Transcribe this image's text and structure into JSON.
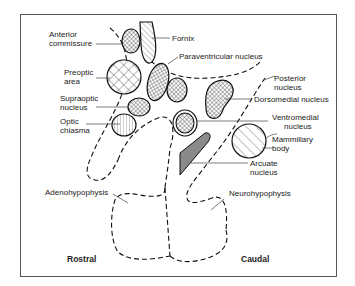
{
  "figure": {
    "type": "anatomical-diagram",
    "orientation": {
      "left": "Rostral",
      "right": "Caudal"
    },
    "colors": {
      "ink": "#111111",
      "arcuate_fill": "#8a8a8a",
      "background": "#ffffff",
      "frame": "#555555"
    }
  },
  "labels": {
    "anterior_commissure": [
      "Anterior",
      "commissure"
    ],
    "fornix": "Fornix",
    "paraventricular": "Paraventricular nucleus",
    "preoptic": [
      "Preoptic",
      "area"
    ],
    "supraoptic": [
      "Supraoptic",
      "nucleus"
    ],
    "optic_chiasma": [
      "Optic",
      "chiasma"
    ],
    "posterior": [
      "Posterior",
      "nucleus"
    ],
    "dorsomedial": "Dorsomedial nucleus",
    "ventromedial": [
      "Ventromedial",
      "nucleus"
    ],
    "mammillary": [
      "Mammillary",
      "body"
    ],
    "arcuate": [
      "Arcuate",
      "nucleus"
    ],
    "adenohypophysis": "Adenohypophysis",
    "neurohypophysis": "Neurohypophysis",
    "rostral": "Rostral",
    "caudal": "Caudal"
  }
}
